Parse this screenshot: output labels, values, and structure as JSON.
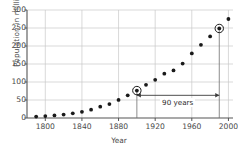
{
  "chart_data": {
    "type": "scatter",
    "title": "",
    "xlabel": "Year",
    "ylabel": "Population in millions",
    "xlim": [
      1780,
      2005
    ],
    "ylim": [
      0,
      300
    ],
    "xticks": [
      1800,
      1840,
      1880,
      1920,
      1960,
      2000
    ],
    "yticks": [
      0,
      50,
      100,
      150,
      200,
      250,
      300
    ],
    "grid": true,
    "legend": null,
    "x": [
      1790,
      1800,
      1810,
      1820,
      1830,
      1840,
      1850,
      1860,
      1870,
      1880,
      1890,
      1900,
      1910,
      1920,
      1930,
      1940,
      1950,
      1960,
      1970,
      1980,
      1990,
      2000
    ],
    "values": [
      3.9,
      5.3,
      7.2,
      9.6,
      12.9,
      17.1,
      23.2,
      31.4,
      38.6,
      50.2,
      62.9,
      76.2,
      92.2,
      106.0,
      123.2,
      132.2,
      151.3,
      179.3,
      203.3,
      226.5,
      248.7,
      275.0
    ],
    "highlighted_points": [
      {
        "x": 1900,
        "y": 76.2,
        "marker": "circled",
        "dropline": true
      },
      {
        "x": 1990,
        "y": 248.7,
        "marker": "circled",
        "dropline": true
      }
    ],
    "annotations": [
      {
        "text": "90 years",
        "type": "double-arrow",
        "x_start": 1900,
        "x_end": 1990,
        "y": 63
      }
    ]
  },
  "axis": {
    "x_title": "Year",
    "y_title": "Population in millions",
    "x_tick_labels": [
      "1800",
      "1840",
      "1880",
      "1920",
      "1960",
      "2000"
    ],
    "y_tick_labels": [
      "0",
      "50",
      "100",
      "150",
      "200",
      "250",
      "300"
    ]
  },
  "annotation": {
    "span_label": "90 years"
  },
  "colors": {
    "marker": "#1a1a1a",
    "grid": "#c8c8c8",
    "axis": "#555555",
    "text": "#4a4a4a",
    "annotation": "#3a3a3a"
  }
}
